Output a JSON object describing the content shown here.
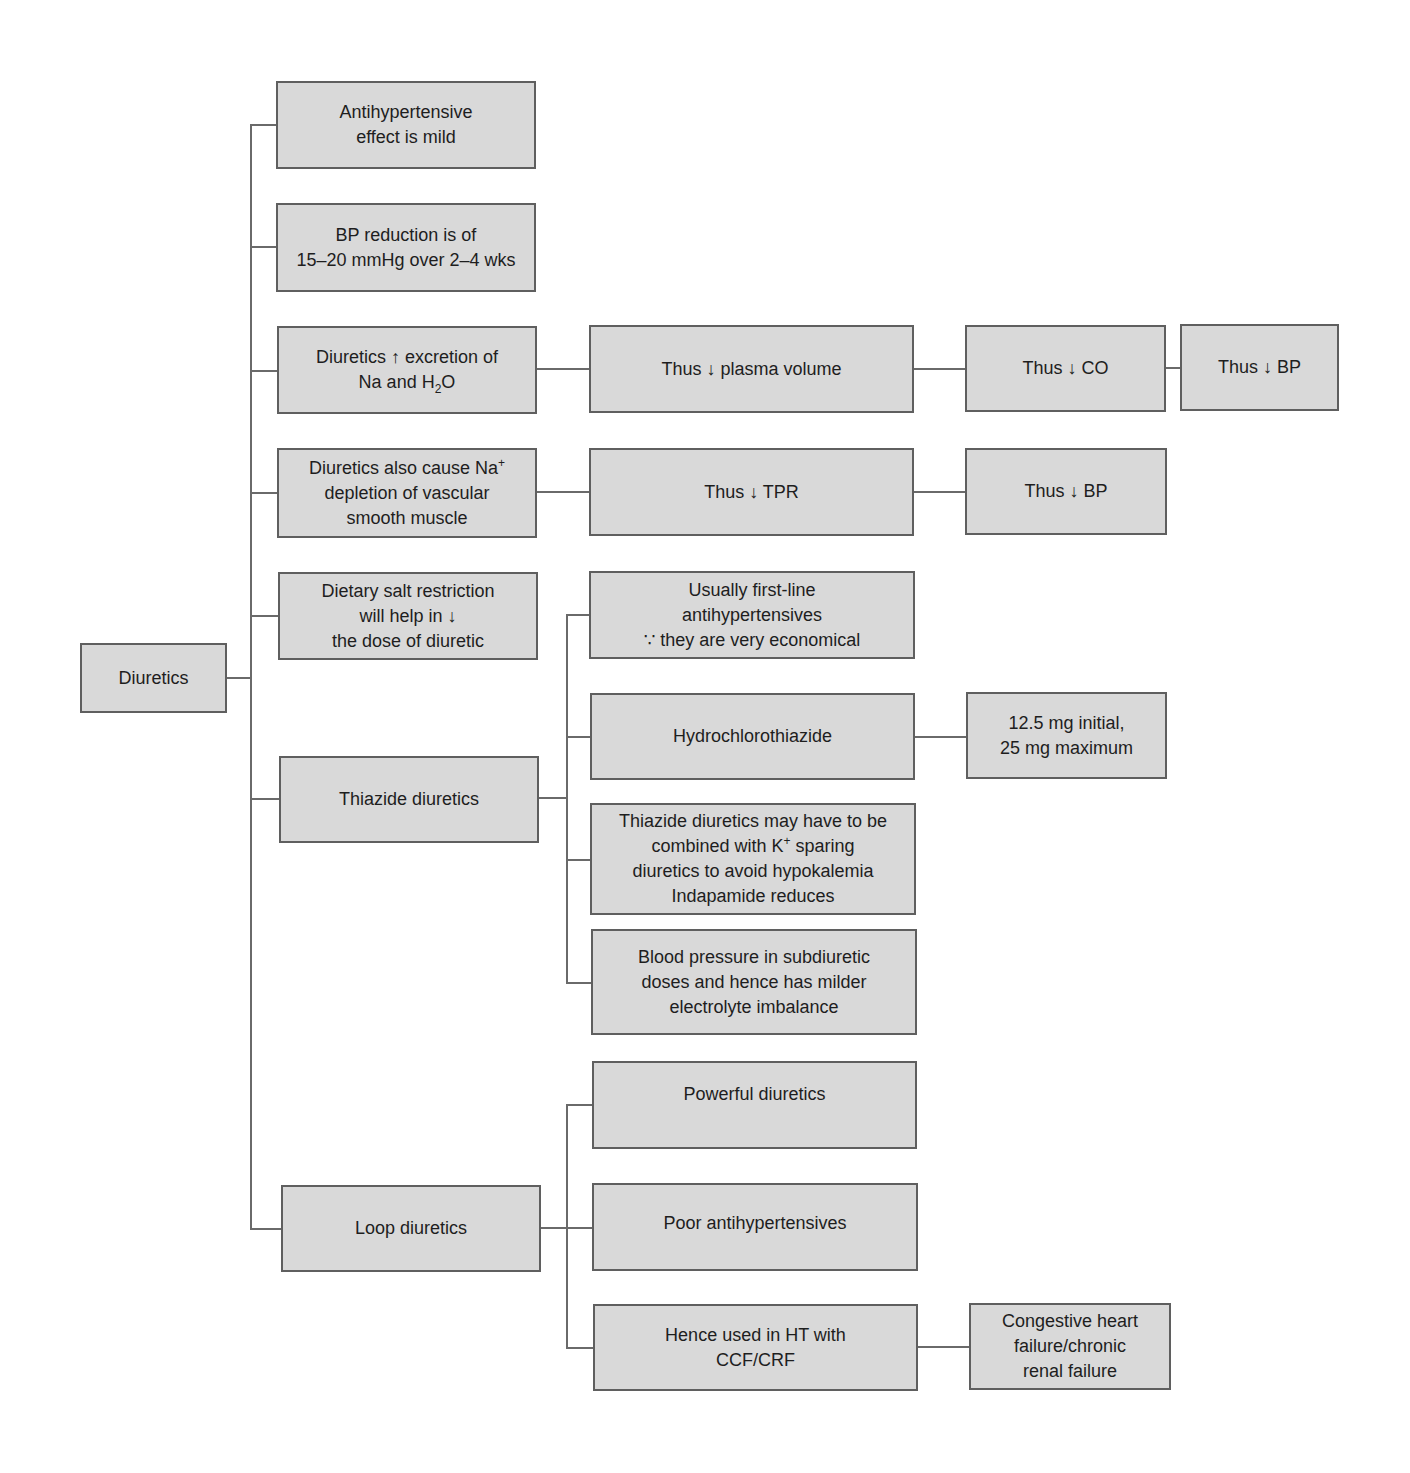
{
  "root": {
    "label": "Diuretics"
  },
  "branches": {
    "b1": {
      "label": "Antihypertensive effect is mild",
      "lines": [
        "Antihypertensive",
        "effect is mild"
      ]
    },
    "b2": {
      "label": "BP reduction is of 15–20 mmHg over 2–4 wks",
      "lines": [
        "BP reduction is of",
        "15–20 mmHg over 2–4 wks"
      ]
    },
    "b3": {
      "label": "Diuretics ↑ excretion of Na and H2O",
      "line1": "Diuretics ↑ excretion of",
      "line2_pre": "Na and H",
      "line2_sub": "2",
      "line2_post": "O",
      "chain": [
        "Thus ↓ plasma volume",
        "Thus ↓ CO",
        "Thus ↓ BP"
      ]
    },
    "b4": {
      "label": "Diuretics also cause Na+ depletion of vascular smooth muscle",
      "line1_pre": "Diuretics also cause Na",
      "line1_sup": "+",
      "line2": "depletion of vascular",
      "line3": "smooth muscle",
      "chain": [
        "Thus ↓ TPR",
        "Thus ↓ BP"
      ]
    },
    "b5": {
      "label": "Dietary salt restriction will help in ↓ the dose of diuretic",
      "lines": [
        "Dietary salt restriction",
        "will help in ↓",
        "the dose of diuretic"
      ]
    },
    "thiazide": {
      "label": "Thiazide diuretics",
      "children": {
        "c1": {
          "lines": [
            "Usually first-line",
            "antihypertensives",
            "∵ they are very economical"
          ]
        },
        "c2": {
          "label": "Hydrochlorothiazide",
          "dose_lines": [
            "12.5 mg initial,",
            "25 mg maximum"
          ]
        },
        "c3": {
          "line1": "Thiazide diuretics may have to be",
          "line2_pre": "combined with K",
          "line2_sup": "+",
          "line2_post": " sparing",
          "line3": "diuretics to avoid hypokalemia",
          "line4": "Indapamide reduces"
        },
        "c4": {
          "lines": [
            "Blood pressure in subdiuretic",
            "doses and hence has milder",
            "electrolyte imbalance"
          ]
        }
      }
    },
    "loop": {
      "label": "Loop diuretics",
      "children": {
        "c1": {
          "label": "Powerful diuretics"
        },
        "c2": {
          "label": "Poor antihypertensives"
        },
        "c3": {
          "lines": [
            "Hence used in HT with",
            "CCF/CRF"
          ],
          "detail_lines": [
            "Congestive heart",
            "failure/chronic",
            "renal failure"
          ]
        }
      }
    }
  },
  "colors": {
    "box_fill": "#d9d9d9",
    "box_border": "#5f5f5f",
    "connector": "#6a6a6a",
    "text": "#1e1e1e",
    "background": "#ffffff"
  }
}
